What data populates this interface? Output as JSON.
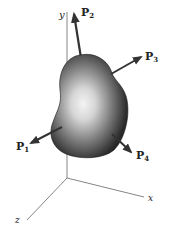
{
  "diagram": {
    "type": "free-body-3d",
    "axes": {
      "x_label": "x",
      "y_label": "y",
      "z_label": "z"
    },
    "forces": [
      {
        "name": "P",
        "sub": "1"
      },
      {
        "name": "P",
        "sub": "2"
      },
      {
        "name": "P",
        "sub": "3"
      },
      {
        "name": "P",
        "sub": "4"
      }
    ],
    "colors": {
      "axis": "#555555",
      "arrow": "#333333",
      "body_dark": "#2a2a2a",
      "body_light": "#f2f2f2"
    }
  }
}
